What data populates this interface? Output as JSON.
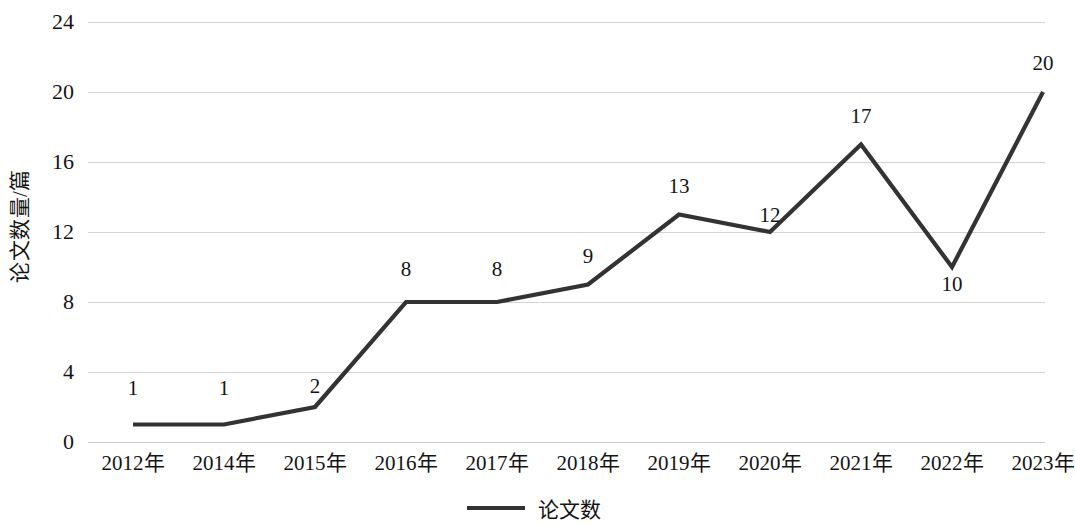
{
  "chart_data": {
    "type": "line",
    "title": "",
    "subtitle": "",
    "xlabel": "",
    "ylabel": "论文数量/篇",
    "categories": [
      "2012年",
      "2014年",
      "2015年",
      "2016年",
      "2017年",
      "2018年",
      "2019年",
      "2020年",
      "2021年",
      "2022年",
      "2023年"
    ],
    "series": [
      {
        "name": "论文数",
        "values": [
          1,
          1,
          2,
          8,
          8,
          9,
          13,
          12,
          17,
          10,
          20
        ],
        "color": "#333333"
      }
    ],
    "data_labels": [
      "1",
      "1",
      "2",
      "8",
      "8",
      "9",
      "13",
      "12",
      "17",
      "10",
      "20"
    ],
    "ylim": [
      0,
      24
    ],
    "ytick_values": [
      0,
      4,
      8,
      12,
      16,
      20,
      24
    ],
    "ytick_labels": [
      "0",
      "4",
      "8",
      "12",
      "16",
      "20",
      "24"
    ],
    "grid": true,
    "grid_color": "#d2d2d2",
    "legend_position": "bottom-center",
    "legend_entries": [
      {
        "label": "论文数",
        "marker": "line",
        "color": "#333333"
      }
    ]
  }
}
